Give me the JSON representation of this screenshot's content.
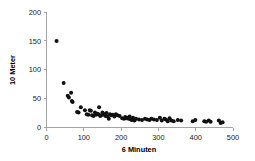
{
  "chart_data": {
    "type": "scatter",
    "title": "",
    "xlabel": "6 Minuten",
    "ylabel": "10 Meter",
    "xlim": [
      0,
      500
    ],
    "ylim": [
      0,
      200
    ],
    "xticks": [
      0,
      100,
      200,
      300,
      400,
      500
    ],
    "yticks": [
      0,
      50,
      100,
      150,
      200
    ],
    "grid": false,
    "legend": null,
    "marker": {
      "shape": "circle",
      "color": "#101010",
      "size": 2.0
    },
    "series": [
      {
        "name": "Messpunkte",
        "points": [
          [
            27,
            150
          ],
          [
            46,
            77
          ],
          [
            57,
            55
          ],
          [
            60,
            52
          ],
          [
            66,
            60
          ],
          [
            68,
            46
          ],
          [
            70,
            44
          ],
          [
            82,
            27
          ],
          [
            86,
            26
          ],
          [
            92,
            35
          ],
          [
            103,
            30
          ],
          [
            108,
            23
          ],
          [
            112,
            22
          ],
          [
            116,
            30
          ],
          [
            119,
            29
          ],
          [
            122,
            21
          ],
          [
            126,
            20
          ],
          [
            130,
            26
          ],
          [
            133,
            22
          ],
          [
            136,
            24
          ],
          [
            139,
            23
          ],
          [
            141,
            35
          ],
          [
            144,
            20
          ],
          [
            147,
            21
          ],
          [
            150,
            26
          ],
          [
            152,
            24
          ],
          [
            155,
            22
          ],
          [
            158,
            20
          ],
          [
            161,
            25
          ],
          [
            164,
            19
          ],
          [
            167,
            15
          ],
          [
            170,
            23
          ],
          [
            174,
            21
          ],
          [
            178,
            22
          ],
          [
            182,
            19
          ],
          [
            186,
            23
          ],
          [
            190,
            21
          ],
          [
            196,
            20
          ],
          [
            203,
            16
          ],
          [
            208,
            15
          ],
          [
            211,
            18
          ],
          [
            214,
            16
          ],
          [
            217,
            17
          ],
          [
            220,
            15
          ],
          [
            223,
            19
          ],
          [
            226,
            14
          ],
          [
            229,
            13
          ],
          [
            232,
            17
          ],
          [
            236,
            12
          ],
          [
            240,
            15
          ],
          [
            248,
            14
          ],
          [
            256,
            13
          ],
          [
            264,
            15
          ],
          [
            270,
            14
          ],
          [
            276,
            13
          ],
          [
            281,
            15
          ],
          [
            288,
            14
          ],
          [
            296,
            13
          ],
          [
            304,
            17
          ],
          [
            309,
            12
          ],
          [
            316,
            15
          ],
          [
            320,
            14
          ],
          [
            325,
            11
          ],
          [
            330,
            16
          ],
          [
            335,
            12
          ],
          [
            341,
            11
          ],
          [
            352,
            13
          ],
          [
            361,
            12
          ],
          [
            392,
            11
          ],
          [
            399,
            13
          ],
          [
            423,
            11
          ],
          [
            428,
            10
          ],
          [
            435,
            12
          ],
          [
            440,
            10
          ],
          [
            462,
            12
          ],
          [
            467,
            8
          ],
          [
            472,
            9
          ]
        ]
      }
    ]
  }
}
